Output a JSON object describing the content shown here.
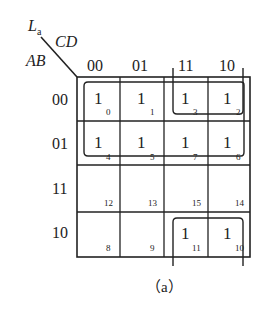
{
  "map": {
    "function_label": "L",
    "function_subscript": "a",
    "col_var_label": "CD",
    "row_var_label": "AB",
    "col_headers": [
      "00",
      "01",
      "11",
      "10"
    ],
    "row_headers": [
      "00",
      "01",
      "11",
      "10"
    ],
    "cells": [
      [
        {
          "value": "1",
          "index": "0"
        },
        {
          "value": "1",
          "index": "1"
        },
        {
          "value": "1",
          "index": "3"
        },
        {
          "value": "1",
          "index": "2"
        }
      ],
      [
        {
          "value": "1",
          "index": "4"
        },
        {
          "value": "1",
          "index": "5"
        },
        {
          "value": "1",
          "index": "7"
        },
        {
          "value": "1",
          "index": "6"
        }
      ],
      [
        {
          "value": "",
          "index": "12"
        },
        {
          "value": "",
          "index": "13"
        },
        {
          "value": "",
          "index": "15"
        },
        {
          "value": "",
          "index": "14"
        }
      ],
      [
        {
          "value": "",
          "index": "8"
        },
        {
          "value": "",
          "index": "9"
        },
        {
          "value": "1",
          "index": "11"
        },
        {
          "value": "1",
          "index": "10"
        }
      ]
    ],
    "groupings": [
      "rows 00-01 all columns (A'B'... top two rows)",
      "columns 11-10 rows 00 (wraps to row 10)",
      "columns 11-10 row 10 (wraps from top)"
    ]
  },
  "caption": "（a）"
}
